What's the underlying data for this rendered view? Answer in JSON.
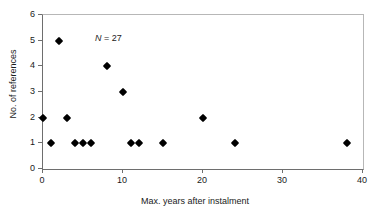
{
  "chart_data": {
    "type": "scatter",
    "title": "",
    "xlabel": "Max. years after instalment",
    "ylabel": "No. of references",
    "xlim": [
      0,
      40
    ],
    "ylim": [
      0,
      6
    ],
    "xticks": [
      0,
      10,
      20,
      30,
      40
    ],
    "yticks": [
      0,
      1,
      2,
      3,
      4,
      5,
      6
    ],
    "xticklabels": [
      "0",
      "10",
      "20",
      "30",
      "40"
    ],
    "yticklabels": [
      "0",
      "1",
      "2",
      "3",
      "4",
      "5",
      "6"
    ],
    "grid": false,
    "legend": null,
    "marker": "diamond",
    "marker_color": "#000000",
    "annotations": [
      {
        "text_symbol": "N",
        "text_rest": " = 27",
        "x": 1,
        "y": 5.7
      }
    ],
    "series": [
      {
        "name": "references",
        "points": [
          {
            "x": 0,
            "y": 2
          },
          {
            "x": 1,
            "y": 1
          },
          {
            "x": 2,
            "y": 5
          },
          {
            "x": 3,
            "y": 2
          },
          {
            "x": 4,
            "y": 1
          },
          {
            "x": 5,
            "y": 1
          },
          {
            "x": 6,
            "y": 1
          },
          {
            "x": 8,
            "y": 4
          },
          {
            "x": 10,
            "y": 3
          },
          {
            "x": 11,
            "y": 1
          },
          {
            "x": 12,
            "y": 1
          },
          {
            "x": 15,
            "y": 1
          },
          {
            "x": 20,
            "y": 2
          },
          {
            "x": 24,
            "y": 1
          },
          {
            "x": 38,
            "y": 1
          }
        ]
      }
    ]
  },
  "annotation_label": {
    "symbol": "N",
    "value": " = 27"
  }
}
